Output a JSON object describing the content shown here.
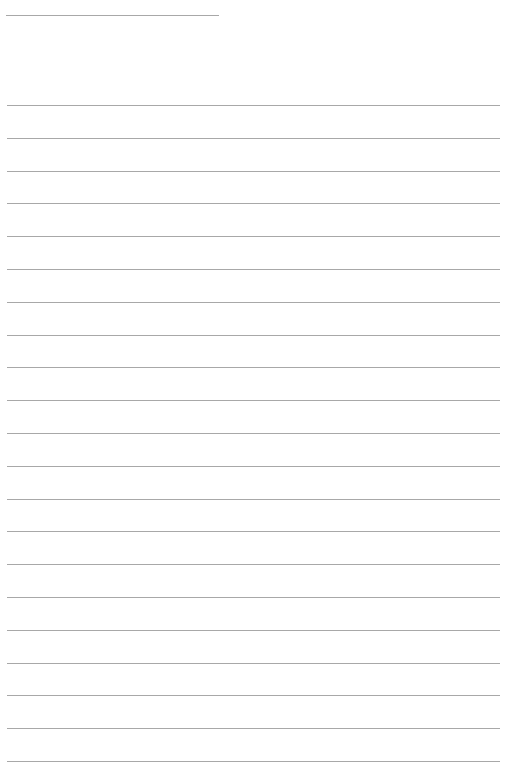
{
  "page": {
    "type": "lined-paper",
    "background_color": "#ffffff",
    "line_color": "#a8a8a8",
    "header_line": {
      "x": 6,
      "y": 15,
      "width": 213
    },
    "rules": {
      "count": 21,
      "first_y": 105,
      "spacing": 32.8,
      "x": 7,
      "width": 493
    }
  }
}
